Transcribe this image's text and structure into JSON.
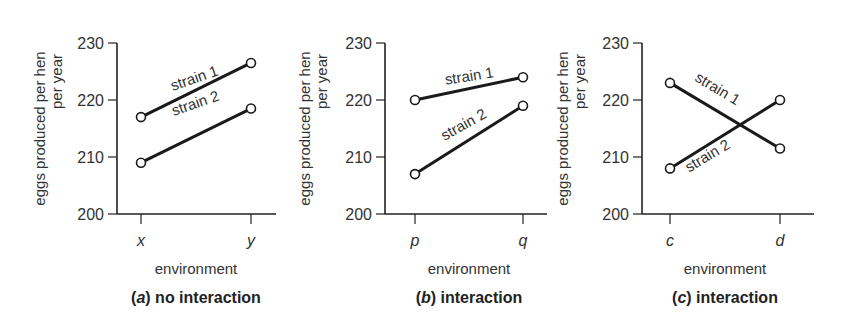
{
  "colors": {
    "line": "#1a1a1a",
    "axis": "#222222",
    "text": "#333333",
    "marker_fill": "#ffffff"
  },
  "chart_data": [
    {
      "type": "line",
      "panel": "a",
      "title": "(a) no interaction",
      "caption_letter": "a",
      "caption_text": "no interaction",
      "xlabel": "environment",
      "ylabel": "eggs produced per hen per year",
      "ylabel_lines": [
        "eggs produced per hen",
        "per year"
      ],
      "categories": [
        "x",
        "y"
      ],
      "ylim": [
        200,
        230
      ],
      "yticks": [
        200,
        210,
        220,
        230
      ],
      "grid": false,
      "legend": "inline labels",
      "series": [
        {
          "name": "strain 1",
          "values": [
            217,
            226.5
          ]
        },
        {
          "name": "strain 2",
          "values": [
            209,
            218.5
          ]
        }
      ]
    },
    {
      "type": "line",
      "panel": "b",
      "title": "(b) interaction",
      "caption_letter": "b",
      "caption_text": "interaction",
      "xlabel": "environment",
      "ylabel": "eggs produced per hen per year",
      "ylabel_lines": [
        "eggs produced per hen",
        "per year"
      ],
      "categories": [
        "p",
        "q"
      ],
      "ylim": [
        200,
        230
      ],
      "yticks": [
        200,
        210,
        220,
        230
      ],
      "grid": false,
      "legend": "inline labels",
      "series": [
        {
          "name": "strain 1",
          "values": [
            220,
            224
          ]
        },
        {
          "name": "strain 2",
          "values": [
            207,
            219
          ]
        }
      ]
    },
    {
      "type": "line",
      "panel": "c",
      "title": "(c) interaction",
      "caption_letter": "c",
      "caption_text": "interaction",
      "xlabel": "environment",
      "ylabel": "eggs produced per hen per year",
      "ylabel_lines": [
        "eggs produced per hen",
        "per year"
      ],
      "categories": [
        "c",
        "d"
      ],
      "ylim": [
        200,
        230
      ],
      "yticks": [
        200,
        210,
        220,
        230
      ],
      "grid": false,
      "legend": "inline labels",
      "series": [
        {
          "name": "strain 1",
          "values": [
            223,
            211.5
          ]
        },
        {
          "name": "strain 2",
          "values": [
            208,
            220
          ]
        }
      ]
    }
  ],
  "layout": {
    "panels": [
      {
        "axis_x": 117,
        "x_end": 276,
        "cat_x": [
          141,
          251
        ],
        "ylabel_x": [
          40,
          57
        ],
        "labels": [
          {
            "series": 0,
            "x": 196,
            "y": 83,
            "rot": -19
          },
          {
            "series": 1,
            "x": 197,
            "y": 108,
            "rot": -19
          }
        ]
      },
      {
        "axis_x": 385,
        "x_end": 547,
        "cat_x": [
          415,
          523
        ],
        "ylabel_x": [
          305,
          322
        ],
        "labels": [
          {
            "series": 0,
            "x": 470,
            "y": 81,
            "rot": -9
          },
          {
            "series": 1,
            "x": 466,
            "y": 129,
            "rot": -29
          }
        ]
      },
      {
        "axis_x": 642,
        "x_end": 814,
        "cat_x": [
          670,
          780
        ],
        "ylabel_x": [
          563,
          580
        ],
        "labels": [
          {
            "series": 0,
            "x": 715,
            "y": 93,
            "rot": 31
          },
          {
            "series": 1,
            "x": 710,
            "y": 160,
            "rot": -31
          }
        ]
      }
    ],
    "y_top": 43,
    "y_bottom": 214,
    "caption_y": 303,
    "xlabel_y": 274,
    "cat_y": 246
  }
}
